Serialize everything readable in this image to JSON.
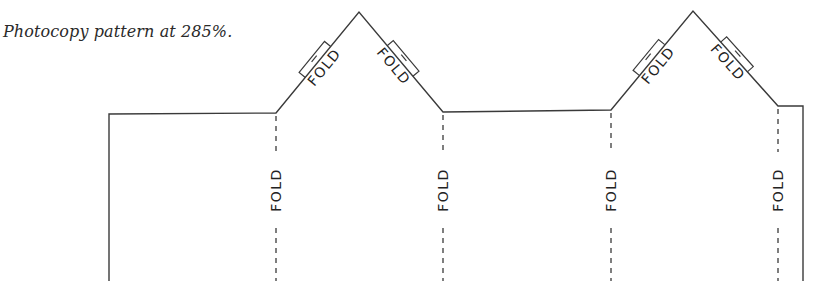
{
  "caption": "Photocopy pattern at 285%.",
  "colors": {
    "line": "#3a3a3a",
    "text": "#222222",
    "background": "#ffffff"
  },
  "fold_label": "FOLD",
  "vertical_folds": [
    {
      "label": "FOLD",
      "x": 276
    },
    {
      "label": "FOLD",
      "x": 443
    },
    {
      "label": "FOLD",
      "x": 611
    },
    {
      "label": "FOLD",
      "x": 778
    }
  ],
  "peak_folds": [
    {
      "side": "left",
      "label": "FOLD",
      "peak": 1
    },
    {
      "side": "right",
      "label": "FOLD",
      "peak": 1
    },
    {
      "side": "left",
      "label": "FOLD",
      "peak": 2
    },
    {
      "side": "right",
      "label": "FOLD",
      "peak": 2
    }
  ]
}
